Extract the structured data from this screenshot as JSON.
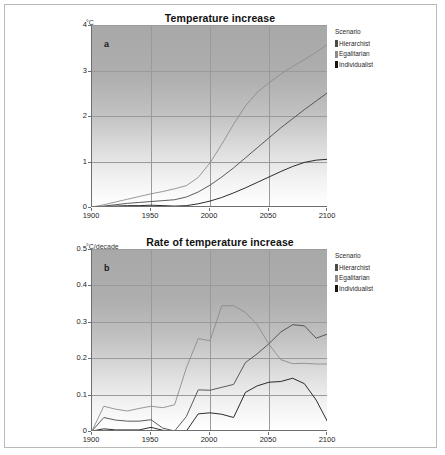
{
  "figure": {
    "border_color": "#b9b9b9",
    "background": "#ffffff"
  },
  "legend": {
    "title": "Scenario",
    "entries": [
      {
        "label": "Hierarchist",
        "color": "#4a4a4a"
      },
      {
        "label": "Egalitarian",
        "color": "#8c8c8c"
      },
      {
        "label": "Individualist",
        "color": "#151515"
      }
    ]
  },
  "panels": [
    {
      "letter": "a",
      "title": "Temperature increase",
      "yunit": "°C"
    },
    {
      "letter": "b",
      "title": "Rate of temperature increase",
      "yunit": "°C/decade"
    }
  ],
  "chart_data": [
    {
      "type": "line",
      "title": "Temperature increase",
      "panel": "a",
      "xlabel": "",
      "ylabel": "°C",
      "xlim": [
        1900,
        2100
      ],
      "ylim": [
        0,
        4
      ],
      "xticks": [
        1900,
        1950,
        2000,
        2050,
        2100
      ],
      "yticks": [
        0,
        1,
        2,
        3,
        4
      ],
      "grid": true,
      "legend_position": "right",
      "x": [
        1900,
        1910,
        1920,
        1930,
        1940,
        1950,
        1960,
        1970,
        1980,
        1990,
        2000,
        2010,
        2020,
        2030,
        2040,
        2050,
        2060,
        2070,
        2080,
        2090,
        2100
      ],
      "series": [
        {
          "name": "Hierarchist",
          "values": [
            0.0,
            0.02,
            0.05,
            0.08,
            0.1,
            0.12,
            0.14,
            0.16,
            0.22,
            0.33,
            0.48,
            0.66,
            0.86,
            1.08,
            1.3,
            1.52,
            1.74,
            1.94,
            2.14,
            2.33,
            2.52
          ]
        },
        {
          "name": "Egalitarian",
          "values": [
            0.0,
            0.05,
            0.11,
            0.17,
            0.23,
            0.29,
            0.34,
            0.4,
            0.47,
            0.65,
            0.97,
            1.38,
            1.82,
            2.22,
            2.52,
            2.73,
            2.92,
            3.09,
            3.24,
            3.4,
            3.58
          ]
        },
        {
          "name": "Individualist",
          "values": [
            0.0,
            0.01,
            0.02,
            0.03,
            0.03,
            0.04,
            0.03,
            0.02,
            0.03,
            0.07,
            0.13,
            0.21,
            0.31,
            0.42,
            0.54,
            0.66,
            0.78,
            0.89,
            0.98,
            1.03,
            1.05
          ]
        }
      ]
    },
    {
      "type": "line",
      "title": "Rate of temperature increase",
      "panel": "b",
      "xlabel": "",
      "ylabel": "°C/decade",
      "xlim": [
        1900,
        2100
      ],
      "ylim": [
        0,
        0.5
      ],
      "xticks": [
        1900,
        1950,
        2000,
        2050,
        2100
      ],
      "yticks": [
        0,
        0.1,
        0.2,
        0.3,
        0.4,
        0.5
      ],
      "grid": true,
      "legend_position": "right",
      "x": [
        1900,
        1910,
        1920,
        1930,
        1940,
        1950,
        1960,
        1970,
        1980,
        1990,
        2000,
        2010,
        2020,
        2030,
        2040,
        2050,
        2060,
        2070,
        2080,
        2090,
        2100
      ],
      "series": [
        {
          "name": "Hierarchist",
          "values": [
            0.0,
            0.037,
            0.03,
            0.027,
            0.027,
            0.031,
            0.008,
            0.0,
            0.04,
            0.113,
            0.112,
            0.12,
            0.128,
            0.188,
            0.212,
            0.24,
            0.272,
            0.292,
            0.289,
            0.255,
            0.267
          ]
        },
        {
          "name": "Egalitarian",
          "values": [
            0.0,
            0.068,
            0.06,
            0.055,
            0.062,
            0.068,
            0.064,
            0.072,
            0.174,
            0.254,
            0.248,
            0.344,
            0.344,
            0.326,
            0.292,
            0.238,
            0.196,
            0.185,
            0.186,
            0.184,
            0.184
          ]
        },
        {
          "name": "Individualist",
          "values": [
            0.0,
            0.006,
            0.003,
            0.003,
            0.003,
            0.01,
            0.002,
            0.0,
            0.0,
            0.047,
            0.05,
            0.046,
            0.037,
            0.106,
            0.124,
            0.134,
            0.136,
            0.145,
            0.13,
            0.085,
            0.023
          ]
        }
      ]
    }
  ]
}
